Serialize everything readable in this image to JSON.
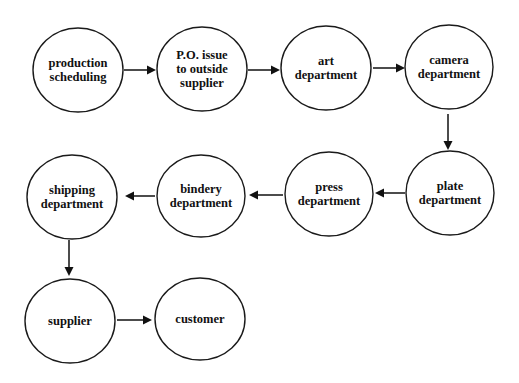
{
  "diagram": {
    "type": "flowchart",
    "title": "",
    "nodes": [
      {
        "id": "production_scheduling",
        "lines": [
          "production",
          "scheduling"
        ],
        "cx": 78,
        "cy": 70,
        "rx": 45,
        "ry": 42
      },
      {
        "id": "po_issue",
        "lines": [
          "P.O. issue",
          "to outside",
          "supplier"
        ],
        "cx": 202,
        "cy": 69,
        "rx": 45,
        "ry": 42
      },
      {
        "id": "art_department",
        "lines": [
          "art",
          "department"
        ],
        "cx": 326,
        "cy": 68,
        "rx": 45,
        "ry": 42
      },
      {
        "id": "camera_department",
        "lines": [
          "camera",
          "department"
        ],
        "cx": 449,
        "cy": 67,
        "rx": 44,
        "ry": 42
      },
      {
        "id": "plate_department",
        "lines": [
          "plate",
          "department"
        ],
        "cx": 450,
        "cy": 193,
        "rx": 44,
        "ry": 42
      },
      {
        "id": "press_department",
        "lines": [
          "press",
          "department"
        ],
        "cx": 329,
        "cy": 194,
        "rx": 44,
        "ry": 42
      },
      {
        "id": "bindery_department",
        "lines": [
          "bindery",
          "department"
        ],
        "cx": 201,
        "cy": 196,
        "rx": 44,
        "ry": 41
      },
      {
        "id": "shipping_department",
        "lines": [
          "shipping",
          "department"
        ],
        "cx": 72,
        "cy": 197,
        "rx": 45,
        "ry": 42
      },
      {
        "id": "supplier",
        "lines": [
          "supplier"
        ],
        "cx": 70,
        "cy": 321,
        "rx": 45,
        "ry": 42
      },
      {
        "id": "customer",
        "lines": [
          "customer"
        ],
        "cx": 200,
        "cy": 319,
        "rx": 45,
        "ry": 41
      }
    ],
    "edges": [
      {
        "from": "production_scheduling",
        "to": "po_issue",
        "x1": 124,
        "y1": 70,
        "x2": 156,
        "y2": 70
      },
      {
        "from": "po_issue",
        "to": "art_department",
        "x1": 248,
        "y1": 70,
        "x2": 280,
        "y2": 70
      },
      {
        "from": "art_department",
        "to": "camera_department",
        "x1": 373,
        "y1": 68,
        "x2": 405,
        "y2": 68
      },
      {
        "from": "camera_department",
        "to": "plate_department",
        "x1": 448,
        "y1": 114,
        "x2": 448,
        "y2": 150
      },
      {
        "from": "plate_department",
        "to": "press_department",
        "x1": 405,
        "y1": 193,
        "x2": 375,
        "y2": 193
      },
      {
        "from": "press_department",
        "to": "bindery_department",
        "x1": 283,
        "y1": 195,
        "x2": 249,
        "y2": 195
      },
      {
        "from": "bindery_department",
        "to": "shipping_department",
        "x1": 155,
        "y1": 196,
        "x2": 125,
        "y2": 196
      },
      {
        "from": "shipping_department",
        "to": "supplier",
        "x1": 69,
        "y1": 240,
        "x2": 69,
        "y2": 276
      },
      {
        "from": "supplier",
        "to": "customer",
        "x1": 117,
        "y1": 320,
        "x2": 152,
        "y2": 320
      }
    ]
  }
}
